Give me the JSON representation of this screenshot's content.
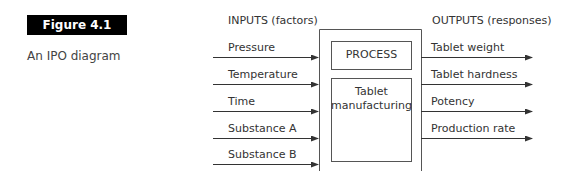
{
  "figure": {
    "label": "Figure 4.1",
    "caption": "An IPO diagram"
  },
  "diagram": {
    "inputs_header": "INPUTS (factors)",
    "outputs_header": "OUTPUTS (responses)",
    "process_label": "PROCESS",
    "process_name_line1": "Tablet",
    "process_name_line2": "manufacturing",
    "inputs": [
      {
        "label": "Pressure"
      },
      {
        "label": "Temperature"
      },
      {
        "label": "Time"
      },
      {
        "label": "Substance A"
      },
      {
        "label": "Substance B"
      }
    ],
    "outputs": [
      {
        "label": "Tablet weight"
      },
      {
        "label": "Tablet hardness"
      },
      {
        "label": "Potency"
      },
      {
        "label": "Production rate"
      }
    ],
    "colors": {
      "line": "#333333",
      "label_bg": "#000000",
      "label_text": "#ffffff"
    }
  }
}
